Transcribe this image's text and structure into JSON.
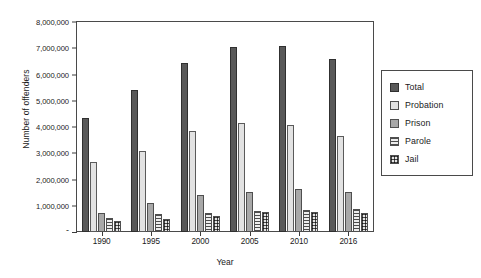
{
  "chart_data": {
    "type": "bar",
    "title": "",
    "xlabel": "Year",
    "ylabel": "Number of offenders",
    "categories": [
      "1990",
      "1995",
      "2000",
      "2005",
      "2010",
      "2016"
    ],
    "series": [
      {
        "name": "Total",
        "values": [
          4350000,
          5400000,
          6450000,
          7060000,
          7090000,
          6610000
        ]
      },
      {
        "name": "Probation",
        "values": [
          2670000,
          3080000,
          3830000,
          4160000,
          4060000,
          3670000
        ]
      },
      {
        "name": "Prison",
        "values": [
          740000,
          1120000,
          1400000,
          1530000,
          1620000,
          1510000
        ]
      },
      {
        "name": "Parole",
        "values": [
          530000,
          700000,
          730000,
          790000,
          850000,
          870000
        ]
      },
      {
        "name": "Jail",
        "values": [
          410000,
          510000,
          620000,
          750000,
          750000,
          740000
        ]
      }
    ],
    "ylim": [
      0,
      8000000
    ],
    "ytick_values": [
      0,
      1000000,
      2000000,
      3000000,
      4000000,
      5000000,
      6000000,
      7000000,
      8000000
    ],
    "ytick_labels": [
      "-",
      "1,000,000",
      "2,000,000",
      "3,000,000",
      "4,000,000",
      "5,000,000",
      "6,000,000",
      "7,000,000",
      "8,000,000"
    ],
    "grid": false,
    "legend_position": "right-outside",
    "legend_entries": [
      "Total",
      "Probation",
      "Prison",
      "Parole",
      "Jail"
    ],
    "colors": {
      "total": "#595959",
      "probation": "#e2e2e2",
      "prison": "#a8a8a8",
      "parole": "#ededed",
      "jail": "#f2f2f2",
      "axis": "#3c3c3c",
      "frame": "#4a4a4a",
      "background": "#ffffff"
    }
  }
}
